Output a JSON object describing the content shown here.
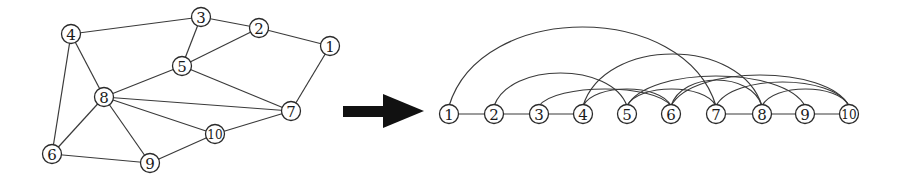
{
  "left_graph": {
    "nodes": [
      {
        "id": "1",
        "x": 330,
        "y": 46
      },
      {
        "id": "2",
        "x": 259,
        "y": 28
      },
      {
        "id": "3",
        "x": 201,
        "y": 17
      },
      {
        "id": "4",
        "x": 71,
        "y": 34
      },
      {
        "id": "5",
        "x": 182,
        "y": 66
      },
      {
        "id": "6",
        "x": 52,
        "y": 154
      },
      {
        "id": "7",
        "x": 291,
        "y": 111
      },
      {
        "id": "8",
        "x": 104,
        "y": 97
      },
      {
        "id": "9",
        "x": 150,
        "y": 163
      },
      {
        "id": "10",
        "x": 215,
        "y": 134
      }
    ],
    "edges": [
      [
        "4",
        "3"
      ],
      [
        "3",
        "2"
      ],
      [
        "2",
        "1"
      ],
      [
        "3",
        "5"
      ],
      [
        "5",
        "2"
      ],
      [
        "4",
        "8"
      ],
      [
        "4",
        "6"
      ],
      [
        "5",
        "8"
      ],
      [
        "5",
        "7"
      ],
      [
        "8",
        "7"
      ],
      [
        "8",
        "10"
      ],
      [
        "8",
        "9"
      ],
      [
        "8",
        "6"
      ],
      [
        "1",
        "7"
      ],
      [
        "10",
        "7"
      ],
      [
        "10",
        "9"
      ],
      [
        "6",
        "9"
      ]
    ]
  },
  "arrow": {
    "label": "transform-arrow",
    "color": "#111111"
  },
  "right_graph": {
    "baseline_y": 114,
    "nodes": [
      {
        "id": "1",
        "x": 449
      },
      {
        "id": "2",
        "x": 494
      },
      {
        "id": "3",
        "x": 539
      },
      {
        "id": "4",
        "x": 583
      },
      {
        "id": "5",
        "x": 627
      },
      {
        "id": "6",
        "x": 671
      },
      {
        "id": "7",
        "x": 716
      },
      {
        "id": "8",
        "x": 762
      },
      {
        "id": "9",
        "x": 805
      },
      {
        "id": "10",
        "x": 849
      }
    ],
    "straight_edges": [
      [
        "1",
        "2"
      ],
      [
        "2",
        "3"
      ],
      [
        "3",
        "4"
      ],
      [
        "7",
        "8"
      ],
      [
        "8",
        "9"
      ],
      [
        "9",
        "10"
      ]
    ],
    "arcs": [
      {
        "from": "1",
        "to": "7",
        "peak_y": 27
      },
      {
        "from": "4",
        "to": "8",
        "peak_y": 54
      },
      {
        "from": "2",
        "to": "5",
        "peak_y": 73
      },
      {
        "from": "3",
        "to": "6",
        "peak_y": 89
      },
      {
        "from": "5",
        "to": "7",
        "peak_y": 89
      },
      {
        "from": "5",
        "to": "9",
        "peak_y": 76
      },
      {
        "from": "6",
        "to": "8",
        "peak_y": 80
      },
      {
        "from": "6",
        "to": "10",
        "peak_y": 75
      },
      {
        "from": "7",
        "to": "10",
        "peak_y": 82
      },
      {
        "from": "8",
        "to": "10",
        "peak_y": 89
      },
      {
        "from": "4",
        "to": "6",
        "peak_y": 89
      }
    ]
  }
}
